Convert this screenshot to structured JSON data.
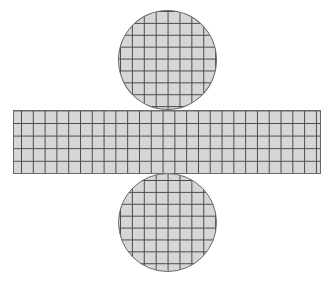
{
  "figure": {
    "components": [
      {
        "name": "top-circle",
        "shape": "circle",
        "center": [
          167,
          60
        ],
        "radius": 49
      },
      {
        "name": "lateral-rectangle",
        "shape": "rectangle",
        "x": 13,
        "y": 110,
        "width": 308,
        "height": 64,
        "grid_columns": 26,
        "grid_rows": 5
      },
      {
        "name": "bottom-circle",
        "shape": "circle",
        "center": [
          167,
          222
        ],
        "radius": 49
      }
    ],
    "colors": {
      "fill": "#d6d6d6",
      "grid_lines": "#4a4a4a",
      "outline": "#6a6a6a",
      "background": "#ffffff"
    }
  }
}
